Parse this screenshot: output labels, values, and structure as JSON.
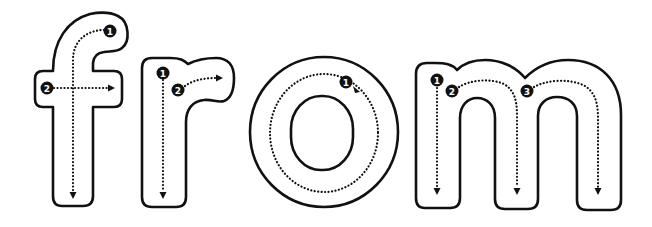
{
  "worksheet": {
    "word": "from",
    "colors": {
      "ink": "#111111",
      "paper": "#ffffff"
    },
    "letters": [
      {
        "char": "f",
        "strokes": [
          {
            "label": "1",
            "direction": "curve-left-then-down"
          },
          {
            "label": "2",
            "direction": "right"
          }
        ]
      },
      {
        "char": "r",
        "strokes": [
          {
            "label": "1",
            "direction": "down"
          },
          {
            "label": "2",
            "direction": "curve-right"
          }
        ]
      },
      {
        "char": "o",
        "strokes": [
          {
            "label": "1",
            "direction": "counterclockwise-loop"
          }
        ]
      },
      {
        "char": "m",
        "strokes": [
          {
            "label": "1",
            "direction": "down"
          },
          {
            "label": "2",
            "direction": "arch-then-down"
          },
          {
            "label": "3",
            "direction": "arch-then-down"
          }
        ]
      }
    ]
  }
}
